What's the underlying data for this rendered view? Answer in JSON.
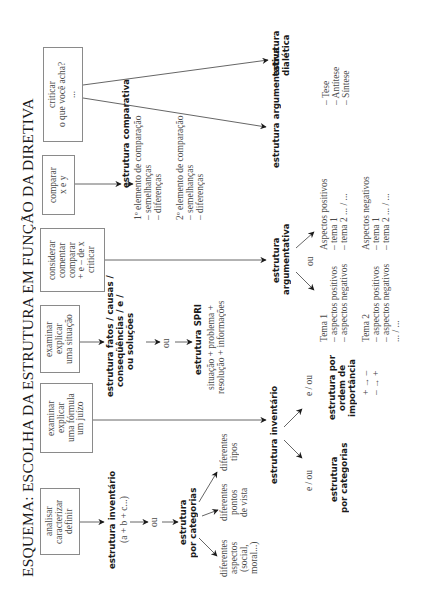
{
  "title": "ESQUEMA: ESCOLHA DA ESTRUTURA EM FUNÇÃO DA DIRETIVA",
  "directives": [
    {
      "id": "analisar",
      "text": "analisar\ncaracterizar\ndefinir"
    },
    {
      "id": "formula",
      "text": "examinar\nexplicar\numa fórmula\num juízo"
    },
    {
      "id": "situacao",
      "text": "examinar\nexplicar\numa situação"
    },
    {
      "id": "considerar",
      "text": "considerar\ncomentar\ncomparar\n+ e – de x\ncriticar"
    },
    {
      "id": "comparar",
      "text": "comparar\nx e y"
    },
    {
      "id": "criticar",
      "text": "criticar\no que você acha?\n..."
    }
  ],
  "branch_analisar": {
    "inventario": "estrutura inventário",
    "formula": "(a + b + c...)",
    "ou": "ou",
    "categorias": "estrutura\npor categorias",
    "leaves": [
      "diferentes\naspectos\n(social,\nmoral...)",
      "diferentes\npontos\nde vista",
      "diferentes\ntipos"
    ]
  },
  "branch_formula": {
    "inventario": "estrutura inventário",
    "e_ou_1": "e / ou",
    "e_ou_2": "e / ou",
    "categorias": "estrutura\npor categorias",
    "importancia": "estrutura por\nordem de\nimportância",
    "importancia_signs": "+ → –\n– → +"
  },
  "branch_situacao": {
    "fatos": "estrutura fatos / causas /\nconseqüências / e /\nou soluções",
    "ou": "ou",
    "spri_title": "estrutura SPRI",
    "spri_desc": "situação + problema +\nresolução + informações"
  },
  "branch_considerar": {
    "argumentativa": "estrutura\nargumentativa",
    "ou": "ou",
    "tema1": "Tema 1\n– aspectos positivos\n– aspectos negativos",
    "tema2": "Tema 2\n– aspectos positivos\n– aspectos negativos\n... / ...",
    "aspectos_pos": "Aspectos positivos\n– tema 1\n– tema 2 ... / ...",
    "aspectos_neg": "Aspectos negativos\n– tema 1\n– tema 2 ... / ..."
  },
  "branch_comparar": {
    "comparativa": "estrutura comparativa",
    "elemento1": "1º elemento de comparação\n– semelhanças\n– diferenças",
    "elemento2": "2º elemento de comparação\n– semelhanças\n– diferenças"
  },
  "branch_criticar": {
    "argumentativa": "estrutura argumentativa",
    "dialetica": "estrutura\ndialética",
    "dialetica_items": "– Tese\n– Antítese\n– Síntese"
  },
  "colors": {
    "line": "#555555",
    "text": "#4a4a4a",
    "bold_text": "#1a1a1a",
    "box_border": "#8a8a8a"
  }
}
